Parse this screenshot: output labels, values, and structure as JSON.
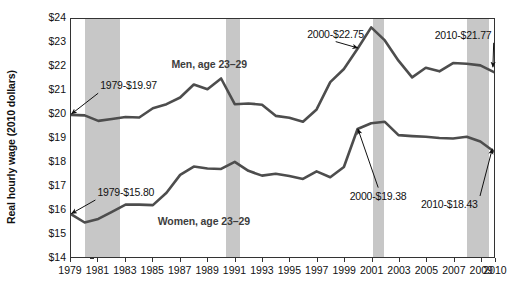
{
  "chart_data": {
    "type": "line",
    "title": "",
    "xlabel": "",
    "ylabel": "Real hourly wage (2010 dollars)",
    "ylim": [
      14,
      24
    ],
    "xlim": [
      1979,
      2010
    ],
    "grid": false,
    "legend_position": "inline-labels",
    "y_tick_labels": [
      "$24",
      "$23",
      "$22",
      "$21",
      "$20",
      "$19",
      "$18",
      "$17",
      "$16",
      "$15",
      "$14"
    ],
    "y_ticks": [
      24,
      23,
      22,
      21,
      20,
      19,
      18,
      17,
      16,
      15,
      14
    ],
    "x_tick_labels": [
      "1979",
      "1981",
      "1983",
      "1985",
      "1987",
      "1989",
      "1991",
      "1993",
      "1995",
      "1997",
      "1999",
      "2001",
      "2003",
      "2005",
      "2007",
      "2009",
      "2010"
    ],
    "x_ticks": [
      1979,
      1981,
      1983,
      1985,
      1987,
      1989,
      1991,
      1993,
      1995,
      1997,
      1999,
      2001,
      2003,
      2005,
      2007,
      2009,
      2010
    ],
    "x": [
      1979,
      1980,
      1981,
      1982,
      1983,
      1984,
      1985,
      1986,
      1987,
      1988,
      1989,
      1990,
      1991,
      1992,
      1993,
      1994,
      1995,
      1996,
      1997,
      1998,
      1999,
      2000,
      2001,
      2002,
      2003,
      2004,
      2005,
      2006,
      2007,
      2008,
      2009,
      2010
    ],
    "series": [
      {
        "name": "Men, age 23–29",
        "color": "#4d4d4d",
        "values": [
          19.97,
          19.95,
          19.72,
          19.8,
          19.88,
          19.86,
          20.25,
          20.42,
          20.7,
          21.25,
          21.05,
          21.5,
          20.42,
          20.45,
          20.4,
          19.93,
          19.85,
          19.68,
          20.2,
          21.35,
          21.9,
          22.75,
          23.65,
          23.1,
          22.25,
          21.55,
          21.95,
          21.8,
          22.15,
          22.12,
          22.05,
          21.77
        ]
      },
      {
        "name": "Women, age 23–29",
        "color": "#4d4d4d",
        "values": [
          15.8,
          15.45,
          15.6,
          15.9,
          16.2,
          16.2,
          16.18,
          16.7,
          17.45,
          17.8,
          17.72,
          17.7,
          18.0,
          17.62,
          17.42,
          17.5,
          17.4,
          17.28,
          17.6,
          17.35,
          17.78,
          19.38,
          19.62,
          19.68,
          19.12,
          19.08,
          19.05,
          19.0,
          18.98,
          19.05,
          18.85,
          18.43
        ]
      }
    ],
    "recession_bands": [
      {
        "start": 1980.0,
        "end": 1982.6
      },
      {
        "start": 1990.3,
        "end": 1991.3
      },
      {
        "start": 2001.0,
        "end": 2001.8
      },
      {
        "start": 2007.9,
        "end": 2009.5
      }
    ],
    "recession_band_color": "#c7c7c7",
    "annotations": [
      {
        "id": "men-1979",
        "text": "1979-$19.97",
        "x": 1981.2,
        "y": 21.2,
        "target_x": 1979.1,
        "target_y": 20.0
      },
      {
        "id": "women-1979",
        "text": "1979-$15.80",
        "x": 1981.0,
        "y": 16.75,
        "target_x": 1979.1,
        "target_y": 15.85
      },
      {
        "id": "men-2000",
        "text": "2000-$22.75",
        "x": 1996.3,
        "y": 23.35,
        "target_x": 2000.0,
        "target_y": 22.75
      },
      {
        "id": "women-2000",
        "text": "2000-$19.38",
        "x": 1999.4,
        "y": 16.6,
        "target_x": 2000.0,
        "target_y": 19.38
      },
      {
        "id": "men-2010",
        "text": "2010-$21.77",
        "x": 2005.6,
        "y": 23.3,
        "target_x": 2009.85,
        "target_y": 21.95
      },
      {
        "id": "women-2010",
        "text": "2010-$18.43",
        "x": 2004.6,
        "y": 16.25,
        "target_x": 2009.8,
        "target_y": 18.55
      }
    ],
    "series_labels": [
      {
        "id": "men-label",
        "text": "Men, age 23–29",
        "x": 1986.4,
        "y": 22.1
      },
      {
        "id": "women-label",
        "text": "Women, age 23–29",
        "x": 1985.4,
        "y": 15.55
      }
    ]
  }
}
